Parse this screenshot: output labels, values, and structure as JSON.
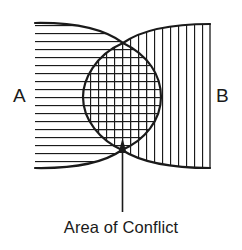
{
  "diagram": {
    "type": "conflict-overlap",
    "regions": [
      {
        "id": "A",
        "label": "A",
        "hatch": "horizontal"
      },
      {
        "id": "B",
        "label": "B",
        "hatch": "vertical"
      },
      {
        "id": "overlap",
        "label": "Area of Conflict",
        "hatch": "cross"
      }
    ],
    "labels": {
      "left": "A",
      "right": "B",
      "annotation": "Area of Conflict"
    },
    "colors": {
      "stroke": "#1a1a1a",
      "background": "#ffffff"
    }
  }
}
